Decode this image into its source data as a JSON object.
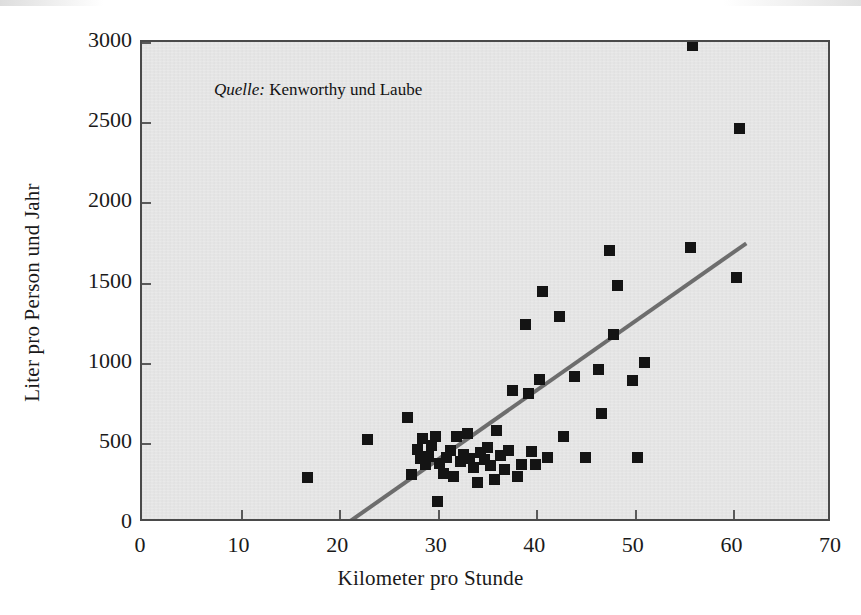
{
  "figure": {
    "source_note_prefix": "Quelle:",
    "source_note_text": " Kenworthy und Laube"
  },
  "chart_data": {
    "type": "scatter",
    "title": "",
    "subtitle": "",
    "xlabel": "Kilometer pro Stunde",
    "ylabel": "Liter pro Person und Jahr",
    "xlim": [
      0,
      70
    ],
    "ylim": [
      0,
      3000
    ],
    "xticks": [
      0,
      10,
      20,
      30,
      40,
      50,
      60,
      70
    ],
    "yticks": [
      0,
      500,
      1000,
      1500,
      2000,
      2500,
      3000
    ],
    "grid": false,
    "legend": null,
    "annotations": [
      {
        "text": "Quelle: Kenworthy und Laube",
        "x": 23.5,
        "y": 2700
      }
    ],
    "marker": {
      "shape": "square",
      "color": "#141414",
      "size_px": 11
    },
    "trendline": {
      "type": "linear",
      "color": "#6d6d6d",
      "x_start": 20.5,
      "y_start": 0,
      "x_end": 61.2,
      "y_end": 1755
    },
    "points": [
      {
        "x": 16.8,
        "y": 281
      },
      {
        "x": 22.9,
        "y": 519
      },
      {
        "x": 26.9,
        "y": 656
      },
      {
        "x": 27.3,
        "y": 300
      },
      {
        "x": 27.9,
        "y": 456
      },
      {
        "x": 28.3,
        "y": 400
      },
      {
        "x": 28.5,
        "y": 525
      },
      {
        "x": 28.8,
        "y": 363
      },
      {
        "x": 29.1,
        "y": 412
      },
      {
        "x": 29.4,
        "y": 481
      },
      {
        "x": 29.8,
        "y": 538
      },
      {
        "x": 30.0,
        "y": 131
      },
      {
        "x": 30.2,
        "y": 369
      },
      {
        "x": 30.6,
        "y": 306
      },
      {
        "x": 30.9,
        "y": 406
      },
      {
        "x": 31.3,
        "y": 450
      },
      {
        "x": 31.6,
        "y": 288
      },
      {
        "x": 31.9,
        "y": 537
      },
      {
        "x": 32.3,
        "y": 381
      },
      {
        "x": 32.6,
        "y": 425
      },
      {
        "x": 33.0,
        "y": 556
      },
      {
        "x": 33.2,
        "y": 400
      },
      {
        "x": 33.6,
        "y": 344
      },
      {
        "x": 34.0,
        "y": 250
      },
      {
        "x": 34.3,
        "y": 437
      },
      {
        "x": 34.7,
        "y": 394
      },
      {
        "x": 35.0,
        "y": 469
      },
      {
        "x": 35.4,
        "y": 356
      },
      {
        "x": 35.8,
        "y": 269
      },
      {
        "x": 36.0,
        "y": 575
      },
      {
        "x": 36.4,
        "y": 419
      },
      {
        "x": 36.8,
        "y": 331
      },
      {
        "x": 37.2,
        "y": 450
      },
      {
        "x": 37.6,
        "y": 825
      },
      {
        "x": 38.1,
        "y": 287
      },
      {
        "x": 38.5,
        "y": 362
      },
      {
        "x": 38.9,
        "y": 1238
      },
      {
        "x": 39.2,
        "y": 806
      },
      {
        "x": 39.5,
        "y": 444
      },
      {
        "x": 39.9,
        "y": 363
      },
      {
        "x": 40.3,
        "y": 894
      },
      {
        "x": 40.6,
        "y": 1444
      },
      {
        "x": 41.1,
        "y": 406
      },
      {
        "x": 42.4,
        "y": 1288
      },
      {
        "x": 42.8,
        "y": 537
      },
      {
        "x": 43.9,
        "y": 913
      },
      {
        "x": 45.0,
        "y": 406
      },
      {
        "x": 46.3,
        "y": 956
      },
      {
        "x": 46.6,
        "y": 681
      },
      {
        "x": 47.4,
        "y": 1700
      },
      {
        "x": 47.8,
        "y": 1175
      },
      {
        "x": 48.2,
        "y": 1481
      },
      {
        "x": 49.8,
        "y": 887
      },
      {
        "x": 50.3,
        "y": 406
      },
      {
        "x": 51.0,
        "y": 1000
      },
      {
        "x": 55.6,
        "y": 1719
      },
      {
        "x": 55.8,
        "y": 2981
      },
      {
        "x": 60.3,
        "y": 1531
      },
      {
        "x": 60.6,
        "y": 2462
      }
    ]
  }
}
